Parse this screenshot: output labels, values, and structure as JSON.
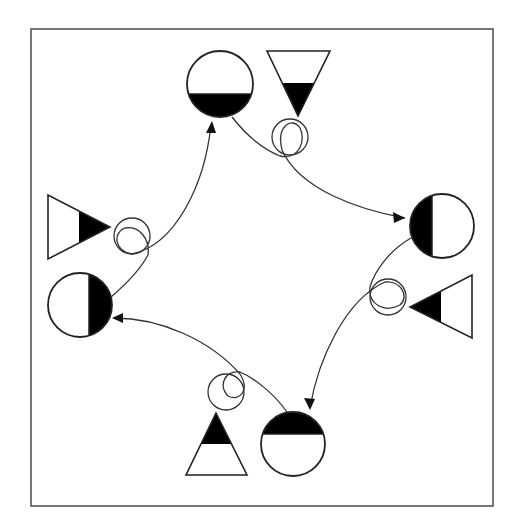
{
  "diagram": {
    "type": "cyclic-transformation",
    "frame": {
      "x": 31,
      "y": 29,
      "width": 462,
      "height": 477,
      "stroke": "#555555"
    },
    "colors": {
      "fill": "#000000",
      "stroke": "#222222",
      "background": "#ffffff"
    },
    "stations": [
      {
        "id": "top",
        "circle": {
          "cx": 220,
          "cy": 84,
          "r": 33,
          "filled_part": "bottom",
          "fill_line": 94
        },
        "triangle": {
          "points": "267,51 330,51 298,116",
          "pointing": "down",
          "filled_part": "lower",
          "fill_line": 83
        },
        "loop": {
          "cx": 290,
          "cy": 137,
          "r": 18
        }
      },
      {
        "id": "right",
        "circle": {
          "cx": 442,
          "cy": 226,
          "r": 32,
          "filled_part": "left",
          "fill_line": 432
        },
        "triangle": {
          "points": "472,275 472,338 410,307",
          "pointing": "left",
          "filled_part": "left",
          "fill_line": 441
        },
        "loop": {
          "cx": 388,
          "cy": 297,
          "r": 18
        }
      },
      {
        "id": "bottom",
        "circle": {
          "cx": 293,
          "cy": 444,
          "r": 32,
          "filled_part": "top",
          "fill_line": 434
        },
        "triangle": {
          "points": "216,413 186,475 247,475",
          "pointing": "up",
          "filled_part": "upper",
          "fill_line": 444
        },
        "loop": {
          "cx": 226,
          "cy": 392,
          "r": 18
        }
      },
      {
        "id": "left",
        "circle": {
          "cx": 80,
          "cy": 305,
          "r": 32,
          "filled_part": "right",
          "fill_line": 89
        },
        "triangle": {
          "points": "48,195 48,259 110,227",
          "pointing": "right",
          "filled_part": "right",
          "fill_line": 79
        },
        "loop": {
          "cx": 132,
          "cy": 236,
          "r": 18
        }
      }
    ],
    "arrows": [
      {
        "from": "top",
        "to": "right",
        "path": "M232,117 C250,140 265,150 280,156 C300,160 306,140 300,128 C292,116 276,126 282,150 C300,190 360,210 405,218",
        "head": "405,218 393,212 394,223"
      },
      {
        "from": "right",
        "to": "bottom",
        "path": "M411,238 C390,250 375,270 370,287 C368,305 385,313 400,305 C410,296 400,280 385,282 C345,300 318,360 310,408",
        "head": "310,410 304,398 315,399"
      },
      {
        "from": "bottom",
        "to": "left",
        "path": "M287,412 C275,395 255,378 240,372 C225,370 218,385 228,396 C240,402 250,390 240,374 C210,340 160,318 114,318",
        "head": "112,318 123,313 123,323"
      },
      {
        "from": "left",
        "to": "top",
        "path": "M111,297 C125,285 140,270 148,255 C150,240 140,225 125,228 C112,233 115,252 132,254 C175,245 205,185 211,124",
        "head": "212,121 206,133 216,133"
      }
    ]
  }
}
